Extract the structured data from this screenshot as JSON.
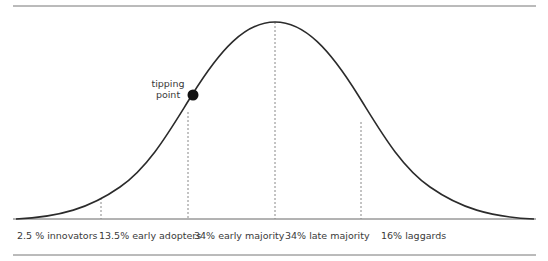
{
  "diagram": {
    "annotation": {
      "line1": "tipping",
      "line2": "point"
    },
    "segments": [
      {
        "label": "2.5 % innovators"
      },
      {
        "label": "13.5% early adopters"
      },
      {
        "label": "34% early majority"
      },
      {
        "label": "34% late majority"
      },
      {
        "label": "16% laggards"
      }
    ],
    "colors": {
      "curve": "#2b2b2b",
      "rule": "#666666",
      "dash": "#888888",
      "dot": "#111111"
    }
  }
}
